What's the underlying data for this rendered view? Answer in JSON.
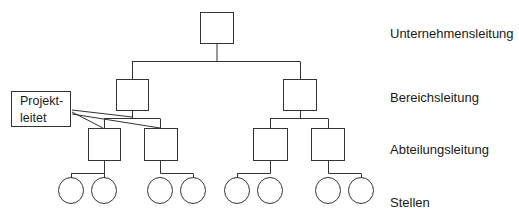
{
  "diagram": {
    "type": "org-chart",
    "levels": [
      {
        "label": "Unternehmensleitung",
        "nodes": 1,
        "shape": "square"
      },
      {
        "label": "Bereichsleitung",
        "nodes": 2,
        "shape": "square"
      },
      {
        "label": "Abteilungsleitung",
        "nodes": 4,
        "shape": "square"
      },
      {
        "label": "Stellen",
        "nodes": 8,
        "shape": "circle"
      }
    ],
    "callout": {
      "line1": "Projekt-",
      "line2": "leitet",
      "connects_to": [
        "Bereichsleitung left",
        "Abteilungsleitung 1",
        "Abteilungsleitung 2"
      ]
    },
    "colors": {
      "line": "#333333",
      "background": "#ffffff",
      "text": "#1a1a1a"
    }
  }
}
